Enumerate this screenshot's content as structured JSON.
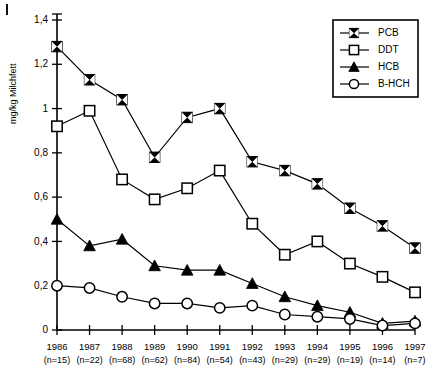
{
  "chart_data": {
    "type": "line",
    "title": "",
    "xlabel": "",
    "ylabel": "mg/kg Milchfett",
    "ylim": [
      0,
      1.4
    ],
    "ytick_values": [
      0,
      0.2,
      0.4,
      0.6,
      0.8,
      1.0,
      1.2,
      1.4
    ],
    "ytick_labels": [
      "0",
      "0,2",
      "0,4",
      "0,6",
      "0,8",
      "1",
      "1,2",
      "1,4"
    ],
    "grid": false,
    "legend_position": "top-right",
    "categories": [
      "1986",
      "1987",
      "1988",
      "1989",
      "1990",
      "1991",
      "1992",
      "1993",
      "1994",
      "1995",
      "1996",
      "1997"
    ],
    "category_sublabels": [
      "(n=15)",
      "(n=22)",
      "(n=68)",
      "(n=62)",
      "(n=84)",
      "(n=54)",
      "(n=43)",
      "(n=29)",
      "(n=29)",
      "(n=19)",
      "(n=14)",
      "(n=7)"
    ],
    "series": [
      {
        "name": "PCB",
        "marker": "crossed-square",
        "values": [
          1.28,
          1.13,
          1.04,
          0.78,
          0.96,
          1.0,
          0.76,
          0.72,
          0.66,
          0.55,
          0.47,
          0.37
        ]
      },
      {
        "name": "DDT",
        "marker": "open-square",
        "values": [
          0.92,
          0.99,
          0.68,
          0.59,
          0.64,
          0.72,
          0.48,
          0.34,
          0.4,
          0.3,
          0.24,
          0.17
        ]
      },
      {
        "name": "HCB",
        "marker": "filled-triangle",
        "values": [
          0.5,
          0.38,
          0.41,
          0.29,
          0.27,
          0.27,
          0.21,
          0.15,
          0.11,
          0.08,
          0.03,
          0.04
        ]
      },
      {
        "name": "B-HCH",
        "marker": "open-circle",
        "values": [
          0.2,
          0.19,
          0.15,
          0.12,
          0.12,
          0.1,
          0.11,
          0.07,
          0.06,
          0.05,
          0.02,
          0.03
        ]
      }
    ]
  },
  "legend": {
    "entries": [
      {
        "label": "PCB",
        "marker": "crossed-square"
      },
      {
        "label": "DDT",
        "marker": "open-square"
      },
      {
        "label": "HCB",
        "marker": "filled-triangle"
      },
      {
        "label": "B-HCH",
        "marker": "open-circle"
      }
    ]
  },
  "colors": {
    "ink": "#000000",
    "background": "#ffffff"
  }
}
